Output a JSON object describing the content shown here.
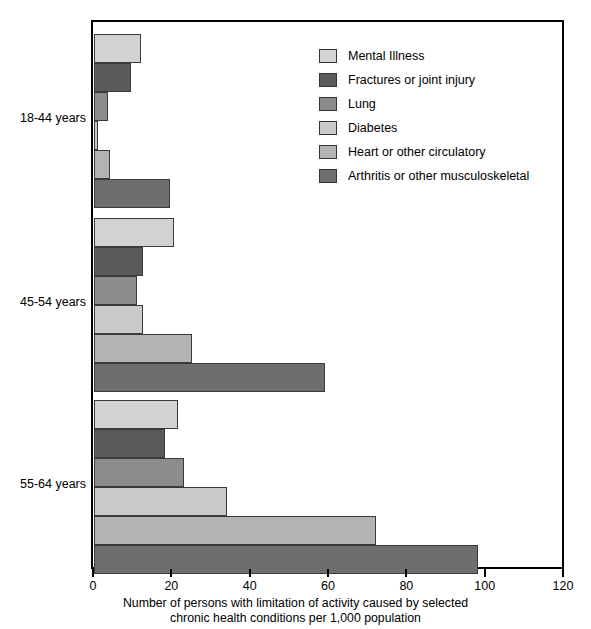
{
  "chart_data": {
    "type": "bar",
    "orientation": "horizontal",
    "title": "",
    "xlabel": "Number of persons with limitation of activity caused by selected chronic health conditions per 1,000 population",
    "ylabel": "",
    "xlim": [
      0,
      120
    ],
    "xticks": [
      0,
      20,
      40,
      60,
      80,
      100,
      120
    ],
    "grid": false,
    "legend_position": "upper right inside",
    "categories": [
      "18-44 years",
      "45-54 years",
      "55-64 years"
    ],
    "series": [
      {
        "name": "Mental Illness",
        "color": "#d2d2d2",
        "values": [
          12,
          20.5,
          21.5
        ]
      },
      {
        "name": "Fractures or joint injury",
        "color": "#5a5a5a",
        "values": [
          9.5,
          12.5,
          18
        ]
      },
      {
        "name": "Lung",
        "color": "#8c8c8c",
        "values": [
          3.5,
          11,
          23
        ]
      },
      {
        "name": "Diabetes",
        "color": "#c9c9c9",
        "values": [
          1,
          12.5,
          34
        ]
      },
      {
        "name": "Heart or other circulatory",
        "color": "#b3b3b3",
        "values": [
          4,
          25,
          72
        ]
      },
      {
        "name": "Arthritis or other musculoskeletal",
        "color": "#6e6e6e",
        "values": [
          19.5,
          59,
          98
        ]
      }
    ]
  },
  "axis": {
    "tick_labels": [
      "0",
      "20",
      "40",
      "60",
      "80",
      "100",
      "120"
    ],
    "title_line1": "Number of persons with limitation of activity caused by selected",
    "title_line2": "chronic health conditions per 1,000 population"
  },
  "category_labels": [
    "18-44 years",
    "45-54 years",
    "55-64 years"
  ],
  "legend": {
    "items": [
      {
        "label": "Mental Illness",
        "color": "#d2d2d2"
      },
      {
        "label": "Fractures or joint injury",
        "color": "#5a5a5a"
      },
      {
        "label": "Lung",
        "color": "#8c8c8c"
      },
      {
        "label": "Diabetes",
        "color": "#c9c9c9"
      },
      {
        "label": "Heart or other circulatory",
        "color": "#b3b3b3"
      },
      {
        "label": "Arthritis or other musculoskeletal",
        "color": "#6e6e6e"
      }
    ]
  }
}
